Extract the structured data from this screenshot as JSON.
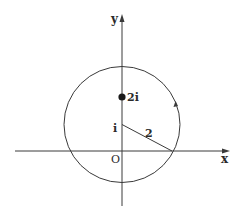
{
  "diagram": {
    "axes": {
      "x_label": "x",
      "y_label": "y",
      "origin_label": "O"
    },
    "circle": {
      "center_label": "i",
      "radius_label": "2",
      "orientation": "counterclockwise"
    },
    "point": {
      "label": "2i"
    },
    "colors": {
      "stroke": "#3a3a3a",
      "text": "#2a2a2a",
      "background": "#ffffff"
    }
  }
}
